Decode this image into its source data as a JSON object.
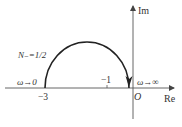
{
  "diagram": {
    "type": "nyquist-plot",
    "axes": {
      "real_label": "Re",
      "imag_label": "Im",
      "origin_label": "O"
    },
    "ticks": [
      {
        "label": "−3",
        "value": -3
      },
      {
        "label": "−1",
        "value": -1
      }
    ],
    "annotations": {
      "start": "ω→0",
      "end": "ω→∞",
      "encirclement": "N₋=1/2"
    },
    "curve": {
      "shape": "semicircle-upper-half",
      "from": -3,
      "to": 0,
      "direction": "clockwise",
      "color": "#222222"
    }
  }
}
